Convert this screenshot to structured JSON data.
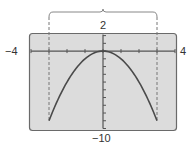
{
  "chart_data": {
    "type": "line",
    "title": "",
    "xlabel": "",
    "ylabel": "",
    "xlim": [
      -4,
      4
    ],
    "ylim": [
      -10,
      2
    ],
    "x_tick_step": 1,
    "y_tick_step": 1,
    "grid": false,
    "function": "y = -x^2",
    "domain": [
      -3,
      3
    ],
    "series": [
      {
        "name": "y = -x^2",
        "x": [
          -3,
          -2.5,
          -2,
          -1.5,
          -1,
          -0.5,
          0,
          0.5,
          1,
          1.5,
          2,
          2.5,
          3
        ],
        "y": [
          -9,
          -6.25,
          -4,
          -2.25,
          -1,
          -0.25,
          0,
          -0.25,
          -1,
          -2.25,
          -4,
          -6.25,
          -9
        ]
      }
    ],
    "annotations": [
      {
        "type": "dashed-vertical-line",
        "x": -3
      },
      {
        "type": "dashed-vertical-line",
        "x": 3
      },
      {
        "type": "brace",
        "from_x": -3,
        "to_x": 3,
        "position": "top"
      }
    ],
    "window_labels": {
      "xmin": "−4",
      "xmax": "4",
      "ymax": "2",
      "ymin": "−10"
    }
  },
  "colors": {
    "window_bg": "#dcdcdc",
    "window_border": "#6a6a6a",
    "axis": "#555555",
    "curve": "#4a4a4a",
    "dashed": "#777777"
  }
}
